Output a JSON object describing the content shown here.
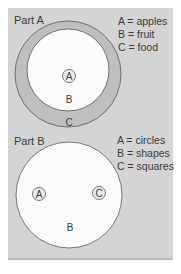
{
  "colors": {
    "panel": "#d4d4d4",
    "ring": "#bfbfbf",
    "circle_fill": "#fbfbfb",
    "stroke": "#555555",
    "text": "#3a3a3a"
  },
  "part_a": {
    "title": "Part A",
    "legend": [
      "A = apples",
      "B = fruit",
      "C = food"
    ],
    "labels": {
      "inner": "A",
      "middle": "B",
      "outer": "C"
    }
  },
  "part_b": {
    "title": "Part B",
    "legend": [
      "A = circles",
      "B = shapes",
      "C = squares"
    ],
    "labels": {
      "left": "A",
      "right": "C",
      "big": "B"
    }
  }
}
